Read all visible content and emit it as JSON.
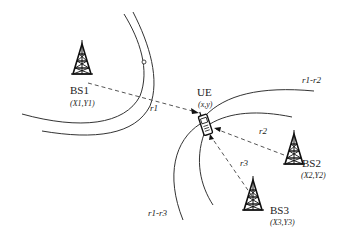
{
  "diagram": {
    "type": "TDOA hyperbolic positioning",
    "base_stations": [
      {
        "id": "BS1",
        "label": "BS1",
        "coords": "(X1,Y1)",
        "x": 79,
        "y": 70
      },
      {
        "id": "BS2",
        "label": "BS2",
        "coords": "(X2,Y2)",
        "x": 292,
        "y": 150
      },
      {
        "id": "BS3",
        "label": "BS3",
        "coords": "(X3,Y3)",
        "x": 253,
        "y": 200
      }
    ],
    "ue": {
      "label": "UE",
      "coords": "(x,y)",
      "x": 206,
      "y": 124
    },
    "ranges": [
      {
        "label": "r1",
        "from": "BS1"
      },
      {
        "label": "r2",
        "from": "BS2"
      },
      {
        "label": "r3",
        "from": "BS3"
      }
    ],
    "hyperbolas": [
      {
        "label": "r1-r2"
      },
      {
        "label": "r1-r3"
      }
    ],
    "colors": {
      "line": "#333333",
      "dashed": "#555555",
      "text": "#222222"
    }
  }
}
